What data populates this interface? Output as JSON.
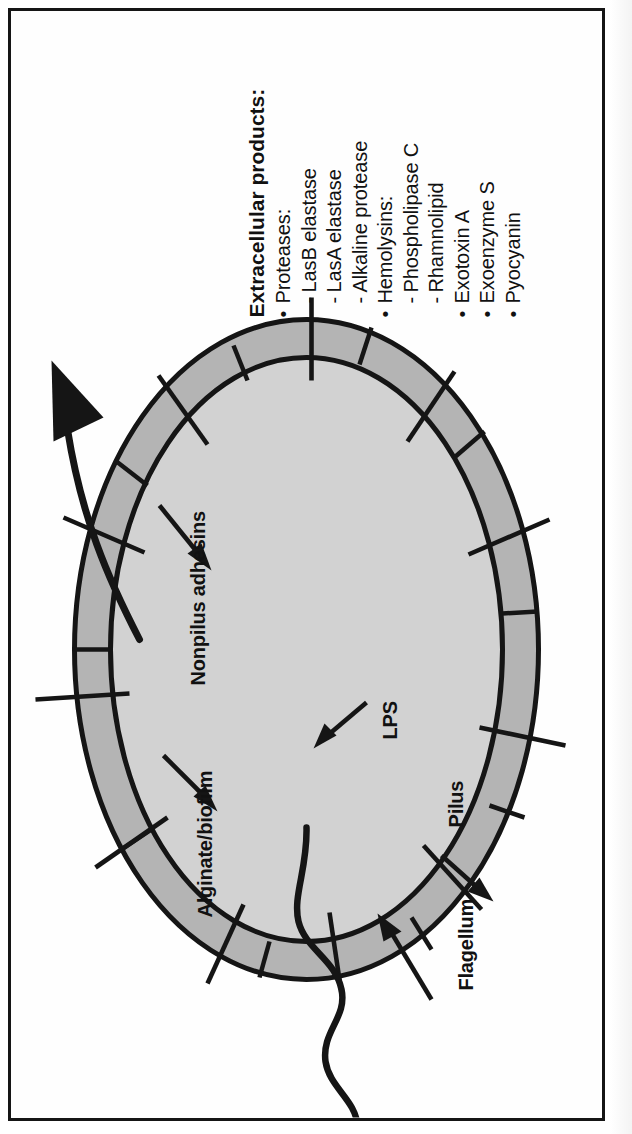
{
  "figure": {
    "type": "diagram",
    "orientation": "rotated-90-counterclockwise"
  },
  "labels": {
    "pilus": "Pilus",
    "lps": "LPS",
    "flagellum": "Flagellum",
    "nonpilus_adhesins": "Nonpilus adhesins",
    "alginate_biofilm": "Alginate/biofilm"
  },
  "products": {
    "heading": "Extracellular products:",
    "items": [
      {
        "marker": "bullet",
        "text": "Proteases:"
      },
      {
        "marker": "dash",
        "text": "LasB elastase"
      },
      {
        "marker": "dash",
        "text": "LasA elastase"
      },
      {
        "marker": "dash",
        "text": "Alkaline protease"
      },
      {
        "marker": "bullet",
        "text": "Hemolysins:"
      },
      {
        "marker": "dash",
        "text": "Phospholipase C"
      },
      {
        "marker": "dash",
        "text": "Rhamnolipid"
      },
      {
        "marker": "bullet",
        "text": "Exotoxin A"
      },
      {
        "marker": "bullet",
        "text": "Exoenzyme S"
      },
      {
        "marker": "bullet",
        "text": "Pyocyanin"
      }
    ]
  },
  "colors": {
    "ink": "#151515",
    "page": "#ffffff",
    "envelope_fill": "#b4b4b4",
    "cytoplasm_fill": "#d2d2d2",
    "border": "#151515"
  },
  "icons": {
    "secretion_arrow": "curved-arrow-icon",
    "pointer_arrow": "arrow-icon",
    "pilus_spike": "pilus-spike-icon",
    "flagellum_filament": "wavy-filament-icon"
  }
}
